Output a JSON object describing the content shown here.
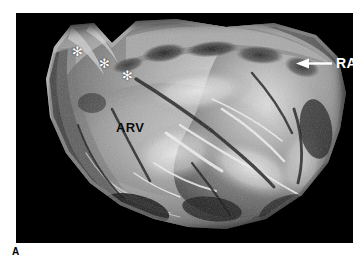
{
  "figure": {
    "panel_letter": "A",
    "modality": "gross-pathology-photograph",
    "background_color": "#000000",
    "page_background_color": "#ffffff"
  },
  "annotations": {
    "arv": {
      "label": "ARV",
      "color": "#0a0a0a",
      "x": 116,
      "y": 121,
      "meaning": "anterior right ventricle"
    },
    "ra": {
      "label": "RA",
      "color": "#ffffff",
      "x": 336,
      "y": 56,
      "meaning": "right atrium",
      "arrow": {
        "direction": "left",
        "color": "#ffffff",
        "x": 296,
        "y": 58,
        "length": 36
      }
    },
    "asterisks": [
      {
        "name": "asterisk-1",
        "glyph": "✻",
        "x": 72,
        "y": 45,
        "color": "#ffffff"
      },
      {
        "name": "asterisk-2",
        "glyph": "✻",
        "x": 99,
        "y": 57,
        "color": "#ffffff"
      },
      {
        "name": "asterisk-3",
        "glyph": "✻",
        "x": 122,
        "y": 69,
        "color": "#ffffff"
      }
    ]
  },
  "photo_frame": {
    "left": 16,
    "top": 13,
    "width": 337,
    "height": 230
  }
}
